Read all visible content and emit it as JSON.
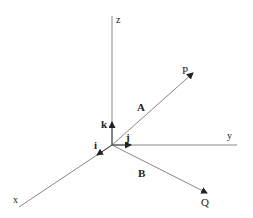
{
  "diagram": {
    "type": "3d-coordinate-vectors",
    "axes": {
      "x": {
        "label": "x"
      },
      "y": {
        "label": "y"
      },
      "z": {
        "label": "z"
      }
    },
    "unit_vectors": {
      "i": {
        "label": "i"
      },
      "j": {
        "label": "j"
      },
      "k": {
        "label": "k"
      }
    },
    "vectors": {
      "A": {
        "label": "A",
        "endpoint": "P"
      },
      "B": {
        "label": "B",
        "endpoint": "Q"
      }
    },
    "points": {
      "P": {
        "label": "P"
      },
      "Q": {
        "label": "Q"
      }
    },
    "colors": {
      "line": "#888888",
      "arrow": "#222222",
      "text": "#222222"
    }
  }
}
